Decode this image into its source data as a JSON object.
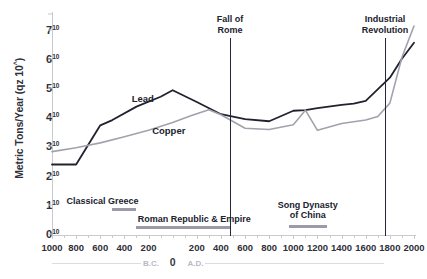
{
  "chart_data": {
    "type": "line",
    "title": "",
    "xlabel": "",
    "ylabel": "Metric Tons/Year (qz 10^)",
    "ylabel_main": "Metric Tons/Year (qz 10",
    "ylabel_sup": "^",
    "ylabel_close": ")",
    "xlim": [
      -1000,
      2000
    ],
    "ylim": [
      0,
      7.6
    ],
    "grid": false,
    "legend": "inline-labels",
    "ytick_base": "10",
    "yticks": [
      {
        "value": 0,
        "mantissa": "0",
        "exp": "10"
      },
      {
        "value": 1,
        "mantissa": "1",
        "exp": "10"
      },
      {
        "value": 2,
        "mantissa": "2",
        "exp": "10"
      },
      {
        "value": 3,
        "mantissa": "3",
        "exp": "10"
      },
      {
        "value": 4,
        "mantissa": "4",
        "exp": "10"
      },
      {
        "value": 5,
        "mantissa": "5",
        "exp": "10"
      },
      {
        "value": 6,
        "mantissa": "6",
        "exp": "10"
      },
      {
        "value": 7,
        "mantissa": "7",
        "exp": "10"
      }
    ],
    "xticks": [
      {
        "value": -1000,
        "label": "1000"
      },
      {
        "value": -800,
        "label": "800"
      },
      {
        "value": -600,
        "label": "600"
      },
      {
        "value": -400,
        "label": "400"
      },
      {
        "value": -200,
        "label": "200"
      },
      {
        "value": 200,
        "label": "200"
      },
      {
        "value": 400,
        "label": "400"
      },
      {
        "value": 600,
        "label": "600"
      },
      {
        "value": 800,
        "label": "800"
      },
      {
        "value": 1000,
        "label": "1000"
      },
      {
        "value": 1200,
        "label": "1200"
      },
      {
        "value": 1400,
        "label": "1400"
      },
      {
        "value": 1600,
        "label": "1600"
      },
      {
        "value": 1800,
        "label": "1800"
      },
      {
        "value": 2000,
        "label": "2000"
      }
    ],
    "era_axis": {
      "bc_label": "B.C.",
      "bc_at": -180,
      "zero_label": "0",
      "zero_at": 0,
      "ad_label": "A.D.",
      "ad_at": 190
    },
    "series": [
      {
        "name": "Lead",
        "color": "#22222e",
        "width": 1.8,
        "label_x": -340,
        "label_y": 4.62,
        "points": [
          [
            -1000,
            2.38
          ],
          [
            -800,
            2.38
          ],
          [
            -600,
            3.72
          ],
          [
            -500,
            3.9
          ],
          [
            -300,
            4.36
          ],
          [
            -100,
            4.7
          ],
          [
            0,
            4.92
          ],
          [
            200,
            4.52
          ],
          [
            400,
            4.1
          ],
          [
            600,
            3.93
          ],
          [
            800,
            3.86
          ],
          [
            1000,
            4.22
          ],
          [
            1100,
            4.24
          ],
          [
            1200,
            4.31
          ],
          [
            1400,
            4.42
          ],
          [
            1500,
            4.46
          ],
          [
            1600,
            4.56
          ],
          [
            1800,
            5.35
          ],
          [
            1900,
            6.0
          ],
          [
            2000,
            6.55
          ]
        ]
      },
      {
        "name": "Copper",
        "color": "#a2a2ad",
        "width": 1.6,
        "label_x": -170,
        "label_y": 3.52,
        "points": [
          [
            -1000,
            2.82
          ],
          [
            -800,
            2.95
          ],
          [
            -600,
            3.12
          ],
          [
            -400,
            3.33
          ],
          [
            -200,
            3.55
          ],
          [
            0,
            3.82
          ],
          [
            150,
            4.05
          ],
          [
            300,
            4.25
          ],
          [
            400,
            4.08
          ],
          [
            600,
            3.62
          ],
          [
            800,
            3.58
          ],
          [
            1000,
            3.74
          ],
          [
            1100,
            4.24
          ],
          [
            1200,
            3.55
          ],
          [
            1400,
            3.78
          ],
          [
            1600,
            3.9
          ],
          [
            1700,
            4.02
          ],
          [
            1800,
            4.48
          ],
          [
            1900,
            6.05
          ],
          [
            2000,
            7.12
          ]
        ]
      }
    ],
    "events": [
      {
        "name": "Fall of Rome",
        "line1": "Fall of",
        "line2": "Rome",
        "at": 476,
        "label_y_top": 14,
        "line_top": 38,
        "line_bottom": 236
      },
      {
        "name": "Industrial Revolution",
        "line1": "Industrial",
        "line2": "Revolution",
        "at": 1760,
        "label_y_top": 14,
        "line_top": 38,
        "line_bottom": 236
      }
    ],
    "eras": [
      {
        "name": "Classical Greece",
        "label": "Classical Greece",
        "bar_start": -500,
        "bar_end": -300,
        "label_x": -880,
        "label_y": 196,
        "bar_y": 208
      },
      {
        "name": "Roman Republic & Empire",
        "label": "Roman Republic & Empire",
        "bar_start": -300,
        "bar_end": 476,
        "label_x": -290,
        "label_y": 214,
        "bar_y": 226
      },
      {
        "name": "Song Dynasty of China",
        "label_line1": "Song Dynasty",
        "label_line2": "of China",
        "bar_start": 960,
        "bar_end": 1279,
        "label_x": 1120,
        "label_y": 200,
        "bar_y": 225
      }
    ]
  }
}
